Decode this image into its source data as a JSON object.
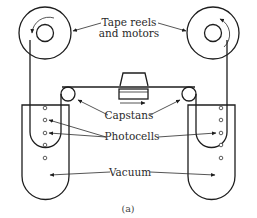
{
  "diagram": {
    "labels": {
      "tape_reels_line1": "Tape reels",
      "tape_reels_line2": "and motors",
      "capstans": "Capstans",
      "photocells": "Photocells",
      "vacuum": "Vacuum"
    },
    "caption": "(a)",
    "components": [
      "left-tape-reel",
      "right-tape-reel",
      "left-capstan",
      "right-capstan",
      "read-write-head",
      "left-vacuum-column",
      "right-vacuum-column",
      "photocells"
    ],
    "reel_rotation": {
      "left": "counterclockwise",
      "right": "counterclockwise"
    },
    "tape_direction": "right",
    "photocells_per_column": 5,
    "colors": {
      "line": "#1e1e1e",
      "background": "#ffffff"
    }
  }
}
